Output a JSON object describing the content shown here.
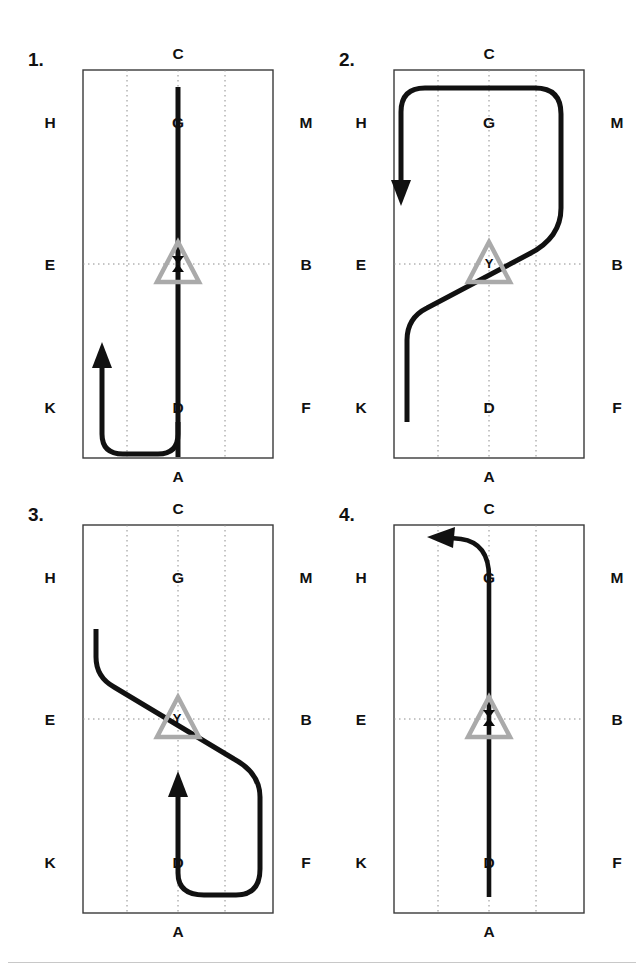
{
  "figure": {
    "type": "multi-panel-trajectory-diagram",
    "panel_count": 4,
    "background_color": "#ffffff",
    "path_color": "#111111",
    "grid_color": "#8c8c8c",
    "border_color": "#3a3a3a",
    "marker_color": "#aaaaaa"
  },
  "panels": [
    {
      "index_label": "1.",
      "labels": {
        "top": "C",
        "bottom": "A",
        "left_top": "H",
        "left_mid": "E",
        "left_bottom": "K",
        "right_top": "M",
        "right_mid": "B",
        "right_bottom": "F",
        "center_top": "G",
        "center_bottom": "D"
      },
      "marker": {
        "shape": "triangle",
        "letter": "X"
      },
      "path_description": "Starts bottom-center at D, descends to bottom edge, curves left along the bottom, then turns upward with an arrowhead pointing up near K; a straight vertical line also runs from bottom-center up through the triangle marker to C",
      "arrow_direction": "up",
      "arrow_position": "left-lower"
    },
    {
      "index_label": "2.",
      "labels": {
        "top": "C",
        "bottom": "A",
        "left_top": "H",
        "left_mid": "E",
        "left_bottom": "K",
        "right_top": "M",
        "right_mid": "B",
        "right_bottom": "F",
        "center_top": "G",
        "center_bottom": "D"
      },
      "marker": {
        "shape": "triangle",
        "letter": "Y"
      },
      "path_description": "Starts at lower-left near K, rises in an S-curve through the triangle marker at center, continues up to the right edge near M, runs along the top edge to the left, then turns down with an arrowhead pointing down near H",
      "arrow_direction": "down",
      "arrow_position": "left-upper"
    },
    {
      "index_label": "3.",
      "labels": {
        "top": "C",
        "bottom": "A",
        "left_top": "H",
        "left_mid": "E",
        "left_bottom": "K",
        "right_top": "M",
        "right_mid": "B",
        "right_bottom": "F",
        "center_top": "G",
        "center_bottom": "D"
      },
      "marker": {
        "shape": "triangle",
        "letter": "Y"
      },
      "path_description": "Starts at upper-left, descends diagonally through the triangle marker at center toward the right edge near F, curves down and left along the bottom, then turns upward at bottom-center with an arrowhead pointing up above D",
      "arrow_direction": "up",
      "arrow_position": "center-lower"
    },
    {
      "index_label": "4.",
      "labels": {
        "top": "C",
        "bottom": "A",
        "left_top": "H",
        "left_mid": "E",
        "left_bottom": "K",
        "right_top": "M",
        "right_mid": "B",
        "right_bottom": "F",
        "center_top": "G",
        "center_bottom": "D"
      },
      "marker": {
        "shape": "triangle",
        "letter": "X"
      },
      "path_description": "A straight vertical line from bottom-center at D up through the triangle marker to G, then curving left near the top edge with an arrowhead pointing left toward H",
      "arrow_direction": "left",
      "arrow_position": "top-left-of-C"
    }
  ]
}
